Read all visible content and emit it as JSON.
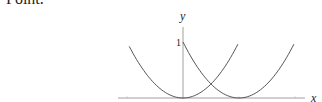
{
  "text": {
    "clipped_heading": "Point."
  },
  "chart_data": {
    "type": "line",
    "title": "",
    "xlabel": "x",
    "ylabel": "y",
    "y_tick_labels": [
      "1"
    ],
    "grid": false,
    "legend": null,
    "xlim": [
      -1.15,
      2.15
    ],
    "ylim": [
      0,
      1.05
    ],
    "series": [
      {
        "name": "y = x^2",
        "x": [
          -0.96,
          -0.75,
          -0.5,
          -0.25,
          0,
          0.25,
          0.5,
          0.75,
          0.98
        ],
        "y": [
          0.92,
          0.5625,
          0.25,
          0.0625,
          0,
          0.0625,
          0.25,
          0.5625,
          0.96
        ]
      },
      {
        "name": "y = (x-1)^2",
        "x": [
          0.0,
          0.25,
          0.5,
          0.75,
          1.0,
          1.25,
          1.5,
          1.75,
          1.98
        ],
        "y": [
          1.0,
          0.5625,
          0.25,
          0.0625,
          0,
          0.0625,
          0.25,
          0.5625,
          0.96
        ]
      }
    ]
  },
  "axes": {
    "x_label": "x",
    "y_label": "y",
    "y_tick_1": "1"
  }
}
